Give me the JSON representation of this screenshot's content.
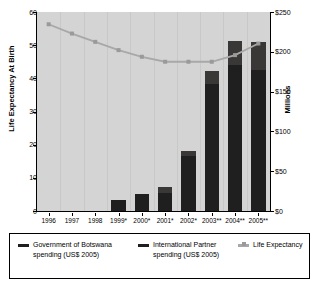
{
  "chart_data": {
    "type": "bar",
    "title": "",
    "subtitle": "",
    "categories": [
      "1996",
      "1997",
      "1998",
      "1999*",
      "2000*",
      "2001*",
      "2002*",
      "2003**",
      "2004**",
      "2005**"
    ],
    "xlabel": "",
    "ylabel": "Life Expectancy At Birth",
    "ylabel_right": "Millions",
    "ylim": [
      0,
      60
    ],
    "yticks": [
      "0",
      "10",
      "20",
      "30",
      "40",
      "50",
      "60"
    ],
    "ylim_right": [
      0,
      250
    ],
    "yticks_right": [
      "$0",
      "$50",
      "$100",
      "$150",
      "$200",
      "$250"
    ],
    "grid": true,
    "legend_position": "bottom",
    "stacked": true,
    "series": [
      {
        "name": "Government of Botswana spending (US$ 2005)",
        "axis": "right",
        "unit": "US$ millions",
        "type": "bar",
        "color": "#201f1f",
        "values": [
          0,
          0,
          0,
          14,
          22,
          23,
          69,
          160,
          183,
          177
        ]
      },
      {
        "name": "International Partner spending (US$ 2005)",
        "axis": "right",
        "unit": "US$ millions",
        "type": "bar",
        "color": "#3a3737",
        "values": [
          0,
          0,
          0,
          0,
          0,
          7,
          7,
          16,
          31,
          35
        ]
      },
      {
        "name": "Life Expectancy",
        "axis": "left",
        "unit": "years",
        "type": "line",
        "color": "#a8a8a8",
        "values": [
          56.3,
          53.5,
          51.0,
          48.5,
          46.5,
          45.0,
          45.0,
          45.0,
          47.0,
          50.5
        ]
      }
    ],
    "totals_right_axis": [
      0,
      0,
      0,
      14,
      22,
      30,
      76,
      176,
      214,
      212
    ]
  },
  "legend": {
    "items": [
      {
        "label": "Government of Botswana spending (US$ 2005)",
        "swatch": "gov",
        "color": "#201f1f"
      },
      {
        "label": "International Partner spending (US$ 2005)",
        "swatch": "partner",
        "color": "#201f1f"
      },
      {
        "label": "Life Expectancy",
        "swatch": "life",
        "color": "#a8a8a8"
      }
    ]
  },
  "colors": {
    "plot_background": "#d4d4d4",
    "government_bar": "#201f1f",
    "partner_bar": "#3a3737",
    "life_line": "#a8a8a8",
    "axis": "#000000"
  }
}
